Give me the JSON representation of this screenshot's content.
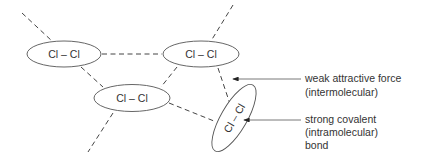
{
  "diagram": {
    "molecules": [
      {
        "id": "mol-left",
        "label": "Cl – Cl"
      },
      {
        "id": "mol-top-right",
        "label": "Cl – Cl"
      },
      {
        "id": "mol-middle",
        "label": "Cl – Cl"
      },
      {
        "id": "mol-rotated",
        "label": "Cl – Cl"
      }
    ],
    "annotations": {
      "weak": {
        "line1": "weak attractive force",
        "line2": "(intermolecular)"
      },
      "strong": {
        "line1": "strong covalent",
        "line2": "(intramolecular)",
        "line3": "bond"
      }
    },
    "colors": {
      "stroke": "#555555",
      "text": "#333333",
      "background": "#ffffff"
    }
  }
}
